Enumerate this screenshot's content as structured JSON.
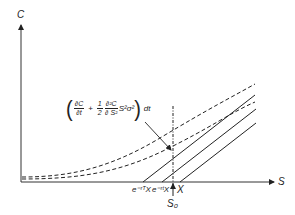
{
  "diagram": {
    "axes": {
      "y_label": "C",
      "x_label": "S"
    },
    "formula": {
      "term1_num": "∂C",
      "term1_den": "∂t",
      "plus": "+",
      "half_num": "1",
      "half_den": "2",
      "term2_num": "∂²C",
      "term2_den": "∂ S²",
      "tail": "S²σ²",
      "dt": "dt"
    },
    "x_markers": {
      "e_rT_X": "e⁻ʳᵀX",
      "e_rt_X": "e⁻ʳᵗX",
      "X": "X",
      "S0": "S₀"
    },
    "series": [
      {
        "name": "option value curve (upper)",
        "style": "dashed"
      },
      {
        "name": "option value curve (lower)",
        "style": "dashed"
      },
      {
        "name": "S - e^{-rT}X",
        "style": "solid"
      },
      {
        "name": "S - e^{-rt}X",
        "style": "solid"
      },
      {
        "name": "S - X",
        "style": "solid"
      },
      {
        "name": "S0 marker",
        "style": "dash-dot vertical"
      }
    ],
    "colors": {
      "ink": "#222222",
      "background": "#ffffff"
    }
  }
}
